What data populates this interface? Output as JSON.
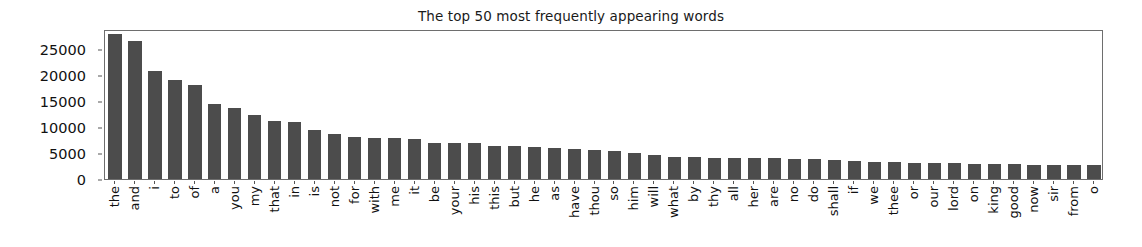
{
  "chart_data": {
    "type": "bar",
    "title": "The top 50 most frequently appearing words",
    "xlabel": "",
    "ylabel": "",
    "ylim": [
      0,
      28800
    ],
    "xlim_note": "50 categorical bars",
    "grid": false,
    "legend": null,
    "bar_color": "#4c4c4c",
    "axes_color": "#6e6e6e",
    "ytick_labels": [
      "0",
      "5000",
      "10000",
      "15000",
      "20000",
      "25000"
    ],
    "ytick_values": [
      0,
      5000,
      10000,
      15000,
      20000,
      25000
    ],
    "categories": [
      "the",
      "and",
      "i",
      "to",
      "of",
      "a",
      "you",
      "my",
      "that",
      "in",
      "is",
      "not",
      "for",
      "with",
      "me",
      "it",
      "be",
      "your",
      "his",
      "this",
      "but",
      "he",
      "as",
      "have",
      "thou",
      "so",
      "him",
      "will",
      "what",
      "by",
      "thy",
      "all",
      "her",
      "are",
      "no",
      "do",
      "shall",
      "if",
      "we",
      "thee",
      "or",
      "our",
      "lord",
      "on",
      "king",
      "good",
      "now",
      "sir",
      "from",
      "o"
    ],
    "values": [
      27800,
      26500,
      20700,
      19100,
      18000,
      14400,
      13600,
      12300,
      11100,
      10900,
      9500,
      8600,
      8100,
      7950,
      7850,
      7600,
      7000,
      7000,
      7000,
      6400,
      6300,
      6100,
      5950,
      5800,
      5500,
      5300,
      5000,
      4600,
      4300,
      4200,
      4100,
      4100,
      4100,
      4100,
      3900,
      3800,
      3600,
      3500,
      3300,
      3200,
      3100,
      3000,
      3000,
      2900,
      2800,
      2800,
      2750,
      2700,
      2650,
      2600
    ]
  }
}
